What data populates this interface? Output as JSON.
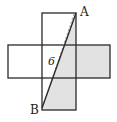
{
  "diagram": {
    "labels": {
      "top_vertex": "A",
      "bottom_vertex": "B",
      "diagonal_length": "6"
    },
    "colors": {
      "stroke": "#2a2a2a",
      "shade": "#e2e2e2",
      "dashed": "#888888"
    }
  }
}
